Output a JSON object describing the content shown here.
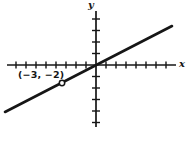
{
  "figure": {
    "background": "#ffffff",
    "ink_color": "#161616",
    "x_axis_label": "x",
    "y_axis_label": "y",
    "point_label": "(−3, −2)"
  },
  "chart_data": {
    "type": "line",
    "title": "",
    "xlabel": "x",
    "ylabel": "y",
    "grid": false,
    "legend": false,
    "x_axis": {
      "label": "x",
      "tick_labels": "none",
      "ticks_left_of_origin": 8,
      "ticks_right_of_origin": 7
    },
    "y_axis": {
      "label": "y",
      "tick_labels": "none",
      "ticks_above_origin": 4,
      "ticks_below_origin": 5
    },
    "series": [
      {
        "name": "line-through-origin",
        "description": "Straight line with positive slope passing through the origin and the point (-3, -2)",
        "slope": 0.6667,
        "y_intercept": 0,
        "points": [
          [
            -3,
            -2
          ],
          [
            0,
            0
          ]
        ]
      }
    ],
    "marked_points": [
      {
        "x": -3,
        "y": -2,
        "label": "(−3, −2)",
        "marker": "open-circle"
      }
    ]
  }
}
